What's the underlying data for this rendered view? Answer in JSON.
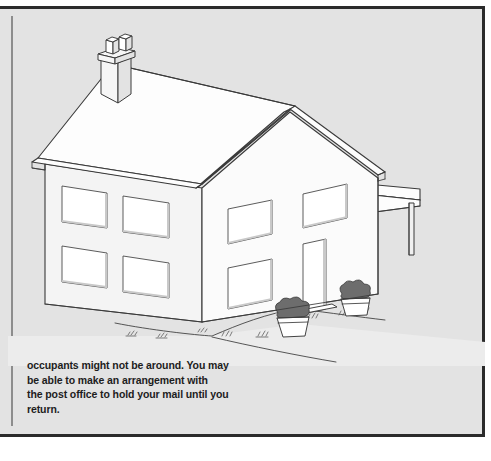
{
  "page": {
    "width": 491,
    "height": 461,
    "background_color": "#ffffff",
    "panel_color": "#e3e3e3",
    "border_color": "#2b2b2b",
    "margin_rule_color": "#8d8d8d"
  },
  "caption": {
    "full_text": "occupants might not be around. You may be able to make an arrangement with the post office to hold your mail until you return.",
    "lines": [
      "occupants might not be around. You may",
      "be able to make an arrangement with",
      "the post office to hold your mail until you",
      "return."
    ],
    "text_color": "#1d1d1d"
  },
  "illustration": {
    "name": "isometric-house-line-drawing",
    "description": "Line drawing of a two-storey detached house seen from a front-left isometric angle, with a chimney, pitched roof, side and front windows, a front door flanked by two potted plants, a side canopy carport on a post, and a curving garden path with grass tufts.",
    "line_color": "#3a3a3a",
    "roof_fill": "#fdfdfd",
    "front_wall_fill": "#fbfbfb",
    "side_wall_fill": "#f3f3f3",
    "ground_fill": "#ededed",
    "window_fill": "#ffffff",
    "parts": [
      {
        "label": "chimney",
        "pots": 2
      },
      {
        "label": "roof"
      },
      {
        "label": "ridge"
      },
      {
        "label": "gable-front-wall"
      },
      {
        "label": "side-wall"
      },
      {
        "label": "front-door"
      },
      {
        "label": "side-windows-upper",
        "count": 2
      },
      {
        "label": "side-windows-lower",
        "count": 2
      },
      {
        "label": "front-windows-upper",
        "count": 2
      },
      {
        "label": "front-window-lower",
        "count": 1
      },
      {
        "label": "canopy-carport"
      },
      {
        "label": "canopy-post"
      },
      {
        "label": "potted-plant-left"
      },
      {
        "label": "potted-plant-right"
      },
      {
        "label": "garden-path"
      },
      {
        "label": "grass-tufts",
        "count": 9
      }
    ]
  }
}
